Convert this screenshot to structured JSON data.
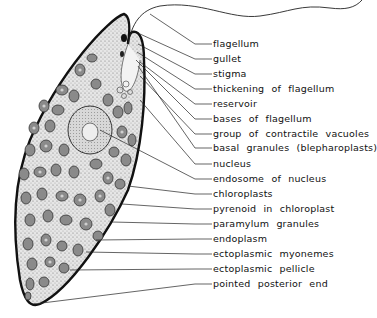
{
  "figure": {
    "labels": [
      {
        "text": "flagellum",
        "y": 44,
        "target": [
          150,
          14
        ]
      },
      {
        "text": "gullet",
        "y": 59,
        "target": [
          140,
          34
        ]
      },
      {
        "text": "stigma",
        "y": 74,
        "target": [
          138,
          44
        ]
      },
      {
        "text": "thickening  of  flagellum",
        "y": 89,
        "target": [
          137,
          52
        ]
      },
      {
        "text": "reservoir",
        "y": 104,
        "target": [
          140,
          62
        ]
      },
      {
        "text": "bases  of  flagellum",
        "y": 119,
        "target": [
          136,
          60
        ]
      },
      {
        "text": "group  of  contractile  vacuoles",
        "y": 134,
        "target": [
          140,
          76
        ]
      },
      {
        "text": "basal  granules  (blepharoplasts)",
        "y": 148,
        "target": [
          138,
          66
        ]
      },
      {
        "text": "nucleus",
        "y": 164,
        "target": [
          140,
          100
        ]
      },
      {
        "text": "endosome  of  nucleus",
        "y": 179,
        "target": [
          100,
          130
        ]
      },
      {
        "text": "chloroplasts",
        "y": 194,
        "target": [
          128,
          186
        ]
      },
      {
        "text": "pyrenoid  in  chloroplast",
        "y": 209,
        "target": [
          122,
          204
        ]
      },
      {
        "text": "paramylum  granules",
        "y": 224,
        "target": [
          112,
          222
        ]
      },
      {
        "text": "endoplasm",
        "y": 239,
        "target": [
          96,
          240
        ]
      },
      {
        "text": "ectoplasmic  myonemes",
        "y": 254,
        "target": [
          86,
          252
        ]
      },
      {
        "text": "ectoplasmic  pellicle",
        "y": 269,
        "target": [
          70,
          270
        ]
      },
      {
        "text": "pointed  posterior  end",
        "y": 284,
        "target": [
          34,
          304
        ]
      }
    ]
  }
}
